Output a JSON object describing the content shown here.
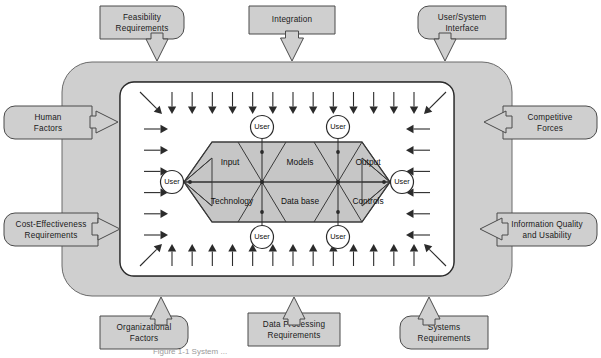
{
  "figure": {
    "caption": "Figure 1-1  System ...",
    "background_color": "#ffffff",
    "band_color": "#cfcfcf",
    "band_stroke": "#5a5a5a",
    "box_fill": "#cfcfcf",
    "box_stroke": "#4a4a4a",
    "inner_panel_fill": "#ffffff",
    "inner_panel_stroke": "#2b2b2b",
    "octagon_fill": "#c6c6c6",
    "octagon_stroke": "#3a3a3a",
    "arrow_color": "#2b2b2b",
    "user_circle_fill": "#ffffff",
    "user_circle_stroke": "#2b2b2b"
  },
  "external_inputs": {
    "top": [
      {
        "id": "feasibility-requirements",
        "label_line1": "Feasibility",
        "label_line2": "Requirements"
      },
      {
        "id": "integration",
        "label_line1": "Integration",
        "label_line2": ""
      },
      {
        "id": "user-system-interface",
        "label_line1": "User/System",
        "label_line2": "Interface"
      }
    ],
    "left": [
      {
        "id": "human-factors",
        "label_line1": "Human",
        "label_line2": "Factors"
      },
      {
        "id": "cost-effectiveness-requirements",
        "label_line1": "Cost-Effectiveness",
        "label_line2": "Requirements"
      }
    ],
    "right": [
      {
        "id": "competitive-forces",
        "label_line1": "Competitive",
        "label_line2": "Forces"
      },
      {
        "id": "information-quality-and-usability",
        "label_line1": "Information Quality",
        "label_line2": "and Usability"
      }
    ],
    "bottom": [
      {
        "id": "organizational-factors",
        "label_line1": "Organizational",
        "label_line2": "Factors"
      },
      {
        "id": "data-processing-requirements",
        "label_line1": "Data Processing",
        "label_line2": "Requirements"
      },
      {
        "id": "systems-requirements",
        "label_line1": "Systems",
        "label_line2": "Requirements"
      }
    ]
  },
  "core": {
    "cells_top": [
      {
        "id": "input",
        "label": "Input"
      },
      {
        "id": "models",
        "label": "Models"
      },
      {
        "id": "output",
        "label": "Output"
      }
    ],
    "cells_bottom": [
      {
        "id": "technology",
        "label": "Technology"
      },
      {
        "id": "data-base",
        "label": "Data base"
      },
      {
        "id": "controls",
        "label": "Controls"
      }
    ]
  },
  "users": {
    "label": "User",
    "positions": [
      {
        "id": "user-top-left",
        "place": "top"
      },
      {
        "id": "user-top-right",
        "place": "top"
      },
      {
        "id": "user-bottom-left",
        "place": "bottom"
      },
      {
        "id": "user-bottom-right",
        "place": "bottom"
      },
      {
        "id": "user-left",
        "place": "left"
      },
      {
        "id": "user-right",
        "place": "right"
      }
    ]
  },
  "flow_arrows": {
    "top_count": 13,
    "bottom_count": 13,
    "left_count": 6,
    "right_count": 6,
    "corner_diagonals": 4,
    "direction_top": "down",
    "direction_bottom": "up",
    "direction_left": "right",
    "direction_right": "left"
  }
}
